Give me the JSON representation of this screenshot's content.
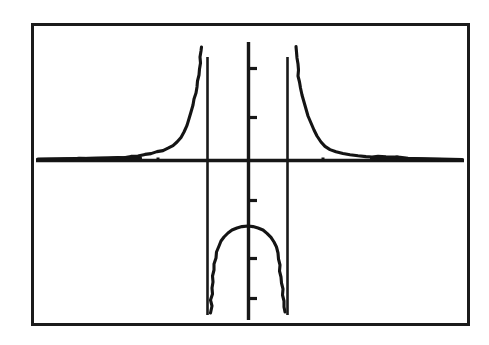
{
  "document": {
    "title": "Graph of a rational function with two vertical asymptotes",
    "background_color": "#ffffff",
    "ink_color": "#161616"
  },
  "frame": {
    "label": "figure-border",
    "x": 31,
    "y": 23,
    "width": 439,
    "height": 303,
    "stroke_color": "#1b1b1b",
    "stroke_width": 3
  },
  "chart_data": {
    "type": "line",
    "title": "",
    "subtitle": "",
    "xlabel": "",
    "ylabel": "",
    "grid": false,
    "legend": false,
    "style": "hand-drawn scanned line graph, black ink on white paper",
    "axes": {
      "x_axis": {
        "pixel_y": 160,
        "pixel_x_start": 36,
        "pixel_x_end": 464,
        "data_value": 0,
        "tick_labels": [],
        "ticks_visible": false
      },
      "y_axis": {
        "pixel_x": 248,
        "pixel_y_start": 42,
        "pixel_y_end": 320,
        "data_value": 0,
        "tick_labels": [],
        "ticks_visible": true,
        "tick_direction": "right",
        "tick_length": 9,
        "tick_pixel_y": [
          68,
          117,
          200,
          258,
          298
        ]
      },
      "xlim": [
        -5.3,
        5.3
      ],
      "ylim": [
        -4.0,
        2.9
      ]
    },
    "asymptotes": [
      {
        "kind": "vertical",
        "pixel_x": 207,
        "pixel_y_top": 57,
        "pixel_y_bottom": 315,
        "x_value": -1
      },
      {
        "kind": "vertical",
        "pixel_x": 287,
        "pixel_y_top": 57,
        "pixel_y_bottom": 315,
        "x_value": 1
      },
      {
        "kind": "horizontal",
        "pixel_y": 160,
        "y_value": 0
      }
    ],
    "series": [
      {
        "name": "left-branch",
        "description": "decays from near x-axis on far left, rises steeply to +infinity at the left vertical asymptote",
        "points_pixel": [
          [
            36,
            160
          ],
          [
            52,
            159
          ],
          [
            70,
            158
          ],
          [
            88,
            158
          ],
          [
            104,
            157
          ],
          [
            118,
            157
          ],
          [
            130,
            156
          ],
          [
            142,
            155
          ],
          [
            152,
            154
          ],
          [
            160,
            152
          ],
          [
            168,
            150
          ],
          [
            174,
            147
          ],
          [
            180,
            143
          ],
          [
            184,
            138
          ],
          [
            188,
            131
          ],
          [
            191,
            122
          ],
          [
            194,
            110
          ],
          [
            196,
            99
          ],
          [
            198,
            88
          ],
          [
            199,
            78
          ],
          [
            200,
            68
          ],
          [
            201,
            58
          ],
          [
            201,
            48
          ]
        ]
      },
      {
        "name": "middle-branch",
        "description": "downward opening arc below the x-axis between the two vertical asymptotes, peak at top center",
        "points_pixel": [
          [
            211,
            312
          ],
          [
            212,
            300
          ],
          [
            213,
            288
          ],
          [
            214,
            276
          ],
          [
            216,
            264
          ],
          [
            219,
            252
          ],
          [
            223,
            242
          ],
          [
            228,
            235
          ],
          [
            234,
            230
          ],
          [
            241,
            227
          ],
          [
            248,
            226
          ],
          [
            255,
            227
          ],
          [
            262,
            230
          ],
          [
            268,
            235
          ],
          [
            273,
            242
          ],
          [
            277,
            252
          ],
          [
            280,
            264
          ],
          [
            282,
            276
          ],
          [
            283,
            288
          ],
          [
            284,
            300
          ],
          [
            285,
            310
          ]
        ]
      },
      {
        "name": "right-branch",
        "description": "falls from +infinity at the right vertical asymptote and decays toward the x-axis on the far right",
        "points_pixel": [
          [
            296,
            47
          ],
          [
            297,
            58
          ],
          [
            298,
            68
          ],
          [
            299,
            78
          ],
          [
            301,
            89
          ],
          [
            303,
            100
          ],
          [
            306,
            112
          ],
          [
            310,
            124
          ],
          [
            314,
            134
          ],
          [
            319,
            142
          ],
          [
            325,
            148
          ],
          [
            332,
            152
          ],
          [
            341,
            154
          ],
          [
            352,
            156
          ],
          [
            364,
            157
          ],
          [
            378,
            158
          ],
          [
            394,
            158
          ],
          [
            412,
            159
          ],
          [
            432,
            159
          ],
          [
            450,
            160
          ],
          [
            464,
            160
          ]
        ]
      }
    ],
    "annotations": [
      {
        "kind": "speck",
        "pixel_x": 125,
        "pixel_y": 158
      },
      {
        "kind": "speck",
        "pixel_x": 158,
        "pixel_y": 159
      },
      {
        "kind": "speck",
        "pixel_x": 323,
        "pixel_y": 159
      },
      {
        "kind": "speck",
        "pixel_x": 397,
        "pixel_y": 157
      }
    ]
  }
}
